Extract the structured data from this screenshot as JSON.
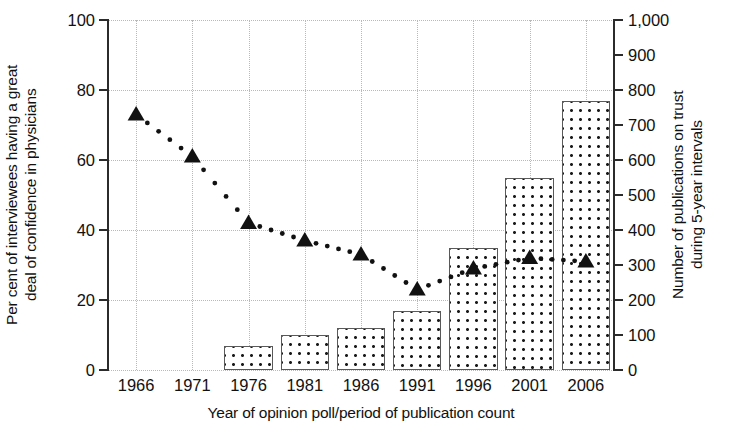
{
  "chart_data": {
    "type": "bar",
    "title": "",
    "xlabel": "Year of opinion poll/period of publication count",
    "ylabel": "Per cent of interviewees having a great\ndeal of confidence in physicians",
    "ylabel_right": "Number of publications on trust\nduring 5-year intervals",
    "categories": [
      "1966",
      "1971",
      "1976",
      "1981",
      "1986",
      "1991",
      "1996",
      "2001",
      "2006"
    ],
    "ylim": [
      0,
      100
    ],
    "yticks": [
      "0",
      "20",
      "40",
      "60",
      "80",
      "100"
    ],
    "ytick_values": [
      0,
      20,
      40,
      60,
      80,
      100
    ],
    "ylim_right": [
      0,
      1000
    ],
    "yticks_right": [
      "0",
      "100",
      "200",
      "300",
      "400",
      "500",
      "600",
      "700",
      "800",
      "900",
      "1,000"
    ],
    "ytick_values_right": [
      0,
      100,
      200,
      300,
      400,
      500,
      600,
      700,
      800,
      900,
      1000
    ],
    "grid": true,
    "legend": "none",
    "series": [
      {
        "name": "Number of publications on trust during 5-year intervals",
        "type": "bar",
        "axis": "right",
        "marker": "dotted-fill-rectangle",
        "values": [
          0,
          0,
          70,
          100,
          120,
          170,
          350,
          550,
          770
        ]
      },
      {
        "name": "Per cent of interviewees having a great deal of confidence in physicians",
        "type": "line",
        "axis": "left",
        "marker": "filled-triangle",
        "linestyle": "dotted",
        "values": [
          73,
          61,
          42,
          37,
          33,
          23,
          29,
          32,
          31
        ]
      }
    ],
    "colors": {
      "axis": "#2b2b2b",
      "grid": "#b9b9b9",
      "bar_border": "#595959",
      "bar_fill": "#ffffff",
      "bar_dots": "#1a1a1a",
      "marker": "#111111"
    }
  }
}
